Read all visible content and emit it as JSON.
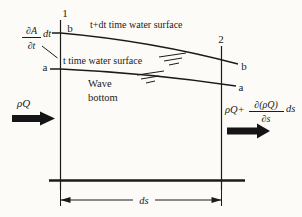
{
  "figure": {
    "sections": {
      "left": "1",
      "right": "2"
    },
    "points": {
      "left_top": "b",
      "left_bottom": "a",
      "right_top": "b",
      "right_bottom": "a"
    },
    "labels": {
      "surface_t_dt": "t+dt time water surface",
      "surface_t": "t time water surface",
      "wave_line1": "Wave",
      "wave_line2": "bottom",
      "inflow": "ρQ",
      "outflow_prefix": "ρQ+",
      "outflow_frac_num": "∂(ρQ)",
      "outflow_frac_den": "∂s",
      "outflow_suffix": "ds",
      "storage_frac_num": "∂A",
      "storage_frac_den": "∂t",
      "storage_suffix": "dt",
      "dimension": "ds"
    },
    "colors": {
      "ink": "#1b1b1b",
      "paper": "#fcfbf8"
    }
  }
}
